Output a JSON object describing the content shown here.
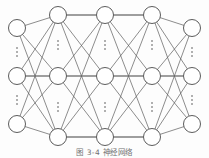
{
  "figure": {
    "caption": "图 3-4  神经网络",
    "background_color": "#fdfdfd",
    "node_fill": "#ffffff",
    "node_stroke": "#4a4a4a",
    "edge_color": "#5c5c5c",
    "horizontal_edge_color": "#6b6b6b",
    "ellipsis_color": "#3c3c3c"
  },
  "network": {
    "layer_count": 5,
    "visible_nodes_per_layer": 3,
    "node_radius": 8.5,
    "ellipsis_label": "⋮",
    "layers": [
      {
        "name": "layer-1",
        "x": 17,
        "nodes": [
          {
            "name": "node-1-1",
            "y": 28
          },
          {
            "name": "node-1-2",
            "y": 76
          },
          {
            "name": "node-1-3",
            "y": 124
          }
        ],
        "ellipses": [
          {
            "name": "ellipsis-1-top",
            "y": 52
          },
          {
            "name": "ellipsis-1-bottom",
            "y": 100
          }
        ]
      },
      {
        "name": "layer-2",
        "x": 58,
        "nodes": [
          {
            "name": "node-2-1",
            "y": 15
          },
          {
            "name": "node-2-2",
            "y": 76
          },
          {
            "name": "node-2-3",
            "y": 137
          }
        ],
        "ellipses": [
          {
            "name": "ellipsis-2-top",
            "y": 45
          },
          {
            "name": "ellipsis-2-bottom",
            "y": 107
          }
        ]
      },
      {
        "name": "layer-3",
        "x": 105,
        "nodes": [
          {
            "name": "node-3-1",
            "y": 15
          },
          {
            "name": "node-3-2",
            "y": 76
          },
          {
            "name": "node-3-3",
            "y": 137
          }
        ],
        "ellipses": [
          {
            "name": "ellipsis-3-top",
            "y": 45
          },
          {
            "name": "ellipsis-3-bottom",
            "y": 107
          }
        ]
      },
      {
        "name": "layer-4",
        "x": 152,
        "nodes": [
          {
            "name": "node-4-1",
            "y": 15
          },
          {
            "name": "node-4-2",
            "y": 76
          },
          {
            "name": "node-4-3",
            "y": 137
          }
        ],
        "ellipses": [
          {
            "name": "ellipsis-4-top",
            "y": 45
          },
          {
            "name": "ellipsis-4-bottom",
            "y": 107
          }
        ]
      },
      {
        "name": "layer-5",
        "x": 192,
        "nodes": [
          {
            "name": "node-5-1",
            "y": 28
          },
          {
            "name": "node-5-2",
            "y": 76
          },
          {
            "name": "node-5-3",
            "y": 124
          }
        ],
        "ellipses": [
          {
            "name": "ellipsis-5-top",
            "y": 52
          },
          {
            "name": "ellipsis-5-bottom",
            "y": 100
          }
        ]
      }
    ]
  }
}
